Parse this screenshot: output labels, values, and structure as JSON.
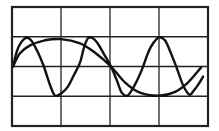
{
  "chart_data": {
    "type": "line",
    "title": "",
    "xlabel": "",
    "ylabel": "",
    "xlim": [
      0,
      4
    ],
    "ylim": [
      -2,
      2
    ],
    "grid": true,
    "grid_divisions": {
      "x": 4,
      "y": 4
    },
    "legend": null,
    "line_color": "#111111",
    "grid_color": "#222222",
    "background": "#ffffff",
    "series": [
      {
        "name": "slow-wave",
        "points": [
          [
            0.02,
            0.0
          ],
          [
            0.16,
            0.44
          ],
          [
            0.37,
            0.71
          ],
          [
            0.67,
            0.88
          ],
          [
            1.0,
            0.92
          ],
          [
            1.39,
            0.78
          ],
          [
            1.69,
            0.47
          ],
          [
            2.02,
            0.0
          ],
          [
            2.31,
            -0.54
          ],
          [
            2.61,
            -0.88
          ],
          [
            3.0,
            -0.98
          ],
          [
            3.33,
            -0.85
          ],
          [
            3.59,
            -0.54
          ],
          [
            3.86,
            -0.03
          ]
        ]
      },
      {
        "name": "fast-wave",
        "points": [
          [
            0.02,
            0.0
          ],
          [
            0.12,
            0.61
          ],
          [
            0.27,
            0.95
          ],
          [
            0.39,
            0.88
          ],
          [
            0.53,
            0.47
          ],
          [
            0.65,
            0.0
          ],
          [
            0.78,
            -0.64
          ],
          [
            0.88,
            -0.98
          ],
          [
            1.02,
            -0.88
          ],
          [
            1.14,
            -0.68
          ],
          [
            1.27,
            -0.27
          ],
          [
            1.39,
            0.14
          ],
          [
            1.47,
            0.64
          ],
          [
            1.55,
            0.95
          ],
          [
            1.65,
            0.95
          ],
          [
            1.76,
            0.75
          ],
          [
            1.88,
            0.41
          ],
          [
            2.02,
            0.0
          ],
          [
            2.14,
            -0.47
          ],
          [
            2.24,
            -0.88
          ],
          [
            2.35,
            -0.98
          ],
          [
            2.45,
            -0.78
          ],
          [
            2.57,
            -0.41
          ],
          [
            2.67,
            -0.03
          ],
          [
            2.78,
            0.47
          ],
          [
            2.88,
            0.78
          ],
          [
            3.0,
            0.98
          ],
          [
            3.12,
            0.88
          ],
          [
            3.22,
            0.54
          ],
          [
            3.35,
            0.0
          ],
          [
            3.47,
            -0.54
          ],
          [
            3.55,
            -0.81
          ],
          [
            3.63,
            -0.95
          ],
          [
            3.71,
            -0.81
          ],
          [
            3.8,
            -0.61
          ],
          [
            3.9,
            -0.34
          ]
        ]
      }
    ]
  },
  "frame": {
    "left": 12,
    "top": 7,
    "width": 196,
    "height": 119
  },
  "a11y": {
    "description": "Two-waveform line plot on a 4x4 grid"
  }
}
